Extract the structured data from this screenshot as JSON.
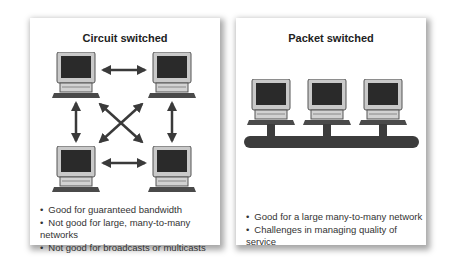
{
  "circuit": {
    "title": "Circuit switched",
    "bullets": [
      "Good for guaranteed bandwidth",
      "Not good for large, many-to-many networks",
      "Not good for broadcasts or multicasts"
    ],
    "nodes": [
      "computer-top-left",
      "computer-top-right",
      "computer-bottom-left",
      "computer-bottom-right"
    ]
  },
  "packet": {
    "title": "Packet switched",
    "bullets": [
      "Good for a large many-to-many network",
      "Challenges in managing quality of service"
    ],
    "nodes": [
      "computer-1",
      "computer-2",
      "computer-3"
    ]
  }
}
